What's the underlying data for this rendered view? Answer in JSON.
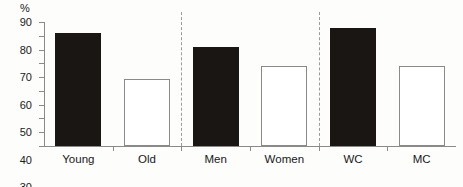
{
  "chart_data": {
    "type": "bar",
    "title": "",
    "xlabel": "",
    "ylabel": "%",
    "ylim": [
      0,
      90
    ],
    "yticks": [
      0,
      10,
      20,
      30,
      40,
      50,
      60,
      70,
      80,
      90
    ],
    "grid": false,
    "legend": null,
    "categories": [
      "Young",
      "Old",
      "Men",
      "Women",
      "WC",
      "MC"
    ],
    "values": [
      82,
      49,
      72,
      58,
      86,
      58
    ],
    "bar_styles": [
      "filled",
      "open",
      "filled",
      "open",
      "filled",
      "open"
    ],
    "group_dividers": [
      "between Old and Men",
      "between Women and WC"
    ],
    "colors": {
      "filled_bar": "#1a1613",
      "open_bar_fill": "#ffffff",
      "open_bar_border": "#8a8a88",
      "axis": "#8a8a88",
      "text": "#18181a",
      "background": "#fdfdfb",
      "divider": "#9b9b99"
    }
  },
  "axis": {
    "unit_label": "%"
  }
}
